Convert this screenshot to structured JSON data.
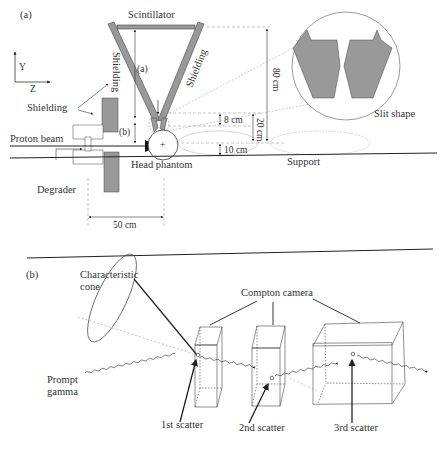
{
  "panel_a": {
    "label": "(a)",
    "scintillator": "Scintillator",
    "shielding_left": "Shielding",
    "shielding_right": "Shielding",
    "shielding": "Shielding",
    "marker_a": "(a)",
    "marker_b": "(b)",
    "axis_y": "Y",
    "axis_z": "Z",
    "proton_beam": "Proton beam",
    "degrader": "Degrader",
    "head_phantom": "Head phantom",
    "support": "Support",
    "slit_shape": "Slit shape",
    "dim_80": "80 cm",
    "dim_20": "20 cm",
    "dim_8": "8 cm",
    "dim_10": "10 cm",
    "dim_50": "50 cm"
  },
  "panel_b": {
    "label": "(b)",
    "characteristic_cone_1": "Characteristic",
    "characteristic_cone_2": "cone",
    "prompt_gamma_1": "Prompt",
    "prompt_gamma_2": "gamma",
    "compton_camera": "Compton camera",
    "scatter_1": "1st scatter",
    "scatter_2": "2nd scatter",
    "scatter_3": "3rd scatter"
  }
}
